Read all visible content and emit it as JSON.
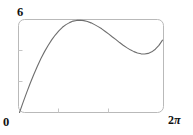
{
  "figure": {
    "kind": "math-plot",
    "background": "#ffffff",
    "frame_color": "#b9b9b9",
    "curve_color": "#6e6e6e",
    "tick_color": "#c2c2c2",
    "label_color": "#111111"
  },
  "labels": {
    "y_max": "6",
    "origin": "0",
    "x_max_number": "2",
    "x_max_symbol": "π"
  },
  "chart_data": {
    "type": "line",
    "title": "",
    "subtitle": "",
    "xlabel": "",
    "ylabel": "",
    "xlim": [
      0,
      6.283185307179586
    ],
    "ylim": [
      0,
      6
    ],
    "xtick_labels": [
      "0",
      "2π"
    ],
    "ytick_labels": [
      "0",
      "6"
    ],
    "xticks_unlabeled": [
      2.0943951023931953,
      4.188790204786391
    ],
    "yticks_unlabeled": [
      2,
      4
    ],
    "grid": false,
    "legend": false,
    "legend_position": "none",
    "annotations": [],
    "series": [
      {
        "name": "curve",
        "description": "rises from origin to a local maximum, dips to a local minimum, then rises steeply to the top-right corner",
        "local_maximum": {
          "x": 1.7,
          "y": 4.2
        },
        "local_minimum": {
          "x": 3.85,
          "y": 2.4
        },
        "endpoints": [
          {
            "x": 0,
            "y": 0
          },
          {
            "x": 6.283185307179586,
            "y": 6
          }
        ],
        "x": [
          0.0,
          0.157,
          0.314,
          0.471,
          0.628,
          0.785,
          0.942,
          1.1,
          1.257,
          1.414,
          1.571,
          1.728,
          1.885,
          2.042,
          2.199,
          2.356,
          2.513,
          2.67,
          2.827,
          2.985,
          3.142,
          3.299,
          3.456,
          3.613,
          3.77,
          3.927,
          4.084,
          4.241,
          4.398,
          4.555,
          4.712,
          4.869,
          5.027,
          5.184,
          5.341,
          5.498,
          5.655,
          5.812,
          5.969,
          6.126,
          6.283
        ],
        "y": [
          0.0,
          0.46,
          0.9,
          1.32,
          1.72,
          2.09,
          2.44,
          2.75,
          3.03,
          3.28,
          3.5,
          3.69,
          3.85,
          3.97,
          4.06,
          4.13,
          4.16,
          4.17,
          4.15,
          4.11,
          4.05,
          3.97,
          3.88,
          3.78,
          3.66,
          3.54,
          3.41,
          3.29,
          3.16,
          3.04,
          2.93,
          2.83,
          2.75,
          2.69,
          2.65,
          2.64,
          2.67,
          2.74,
          2.86,
          3.03,
          3.27
        ]
      }
    ]
  }
}
